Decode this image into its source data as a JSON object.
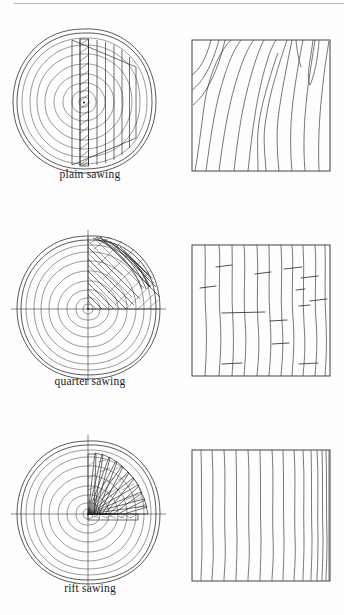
{
  "document": {
    "title": "Wood Sawing Methods Diagram",
    "type": "technical-illustration",
    "background_color": "#fefefe",
    "line_color": "#3a3a3a"
  },
  "figures": [
    {
      "id": "plain-sawing",
      "caption": "plain sawing",
      "log": {
        "label": "log-cross-section-plain",
        "description": "log end grain with concentric growth rings and parallel vertical saw cuts on the right side",
        "pith": {
          "cx": 74,
          "cy": 81
        },
        "ring_count": 9,
        "cut_orientation": "vertical-parallel",
        "cut_count": 9,
        "hatched_board_index": 3,
        "has_crosshair_axes": false
      },
      "board": {
        "label": "board-face-plain",
        "description": "flat sawn board face showing cathedral arch grain figure",
        "grain_type": "cathedral-arch",
        "grain_line_count": 13,
        "has_ray_flecks": false
      }
    },
    {
      "id": "quarter-sawing",
      "caption": "quarter sawing",
      "log": {
        "label": "log-cross-section-quarter",
        "description": "log end grain quartered by crosshair axes with upper-right quadrant cut into diagonal crosshatched boards",
        "pith": {
          "cx": 78,
          "cy": 88
        },
        "ring_count": 9,
        "cut_orientation": "diagonal-quadrant",
        "cut_count": 8,
        "hatched_board_index": 0,
        "has_crosshair_axes": true
      },
      "board": {
        "label": "board-face-quarter",
        "description": "quarter sawn board face with straight vertical grain and horizontal medullary ray flecks",
        "grain_type": "straight-vertical",
        "grain_line_count": 11,
        "has_ray_flecks": true,
        "ray_fleck_count": 13
      }
    },
    {
      "id": "rift-sawing",
      "caption": "rift sawing",
      "log": {
        "label": "log-cross-section-rift",
        "description": "log end grain with radial wedge boards fanning from the pith through the upper-right quadrant",
        "pith": {
          "cx": 78,
          "cy": 88
        },
        "ring_count": 9,
        "cut_orientation": "radial-fan",
        "cut_count": 13,
        "hatched_board_index": 12,
        "has_crosshair_axes": true
      },
      "board": {
        "label": "board-face-rift",
        "description": "rift sawn board face with tight uniform straight vertical grain",
        "grain_type": "straight-tight-vertical",
        "grain_line_count": 15,
        "has_ray_flecks": false
      }
    }
  ]
}
